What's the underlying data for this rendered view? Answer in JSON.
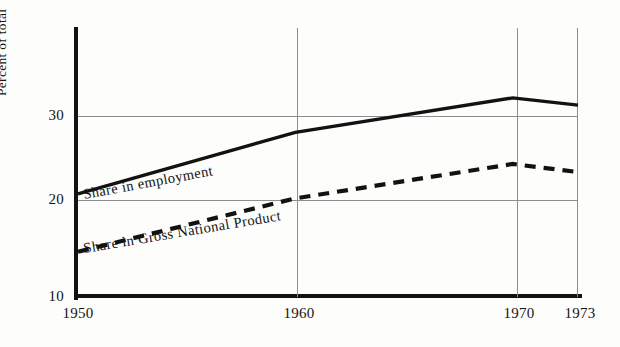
{
  "chart_data": {
    "type": "line",
    "title": "",
    "xlabel": "",
    "ylabel": "Percent of total",
    "x": [
      1950,
      1960,
      1970,
      1973
    ],
    "xtick_labels": [
      "1950",
      "1960",
      "1970",
      "1973"
    ],
    "ytick_labels": [
      "30",
      "20",
      "10"
    ],
    "ytick_values": [
      30,
      20,
      10
    ],
    "xlim": [
      1950,
      1973
    ],
    "ylim": [
      10,
      40.5
    ],
    "grid": "gridlines at y=20 and y=30; vertical gridlines at 1960, 1970, 1973",
    "legend": "inline labels on the curves",
    "series": [
      {
        "name": "Share in employment",
        "style": "solid",
        "color": "#121212",
        "values": [
          21.4,
          28.2,
          32.0,
          31.2
        ]
      },
      {
        "name": "Share in Gross National Product",
        "style": "dashed",
        "color": "#121212",
        "values": [
          15.0,
          20.9,
          24.7,
          23.8
        ]
      }
    ]
  },
  "axis": {
    "y_title": "Percent of total",
    "y_ticks": [
      {
        "label": "30",
        "value": 30
      },
      {
        "label": "20",
        "value": 20
      },
      {
        "label": "10",
        "value": 10
      }
    ],
    "x_ticks": [
      {
        "label": "1950",
        "value": 1950
      },
      {
        "label": "1960",
        "value": 1960
      },
      {
        "label": "1970",
        "value": 1970
      },
      {
        "label": "1973",
        "value": 1973
      }
    ]
  },
  "labels": {
    "employment": "Share in employment",
    "gnp": "Share in Gross National Product"
  },
  "colors": {
    "ink": "#121212",
    "grid": "#8e8e8e",
    "paper": "#fdfdfb"
  }
}
